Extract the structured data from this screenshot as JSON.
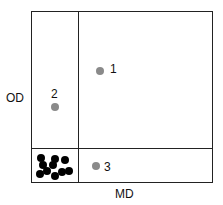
{
  "diagram": {
    "axes": {
      "x_label": "MD",
      "y_label": "OD"
    },
    "points": [
      {
        "label": "1",
        "x": 100,
        "y": 71,
        "lx": 110,
        "ly": 63
      },
      {
        "label": "2",
        "x": 55,
        "y": 107,
        "lx": 51,
        "ly": 88
      },
      {
        "label": "3",
        "x": 96,
        "y": 166,
        "lx": 104,
        "ly": 161
      }
    ],
    "cluster": [
      [
        41,
        158
      ],
      [
        55,
        159
      ],
      [
        65,
        160
      ],
      [
        43,
        165
      ],
      [
        53,
        165
      ],
      [
        40,
        174
      ],
      [
        47,
        171
      ],
      [
        55,
        176
      ],
      [
        62,
        172
      ],
      [
        69,
        171
      ]
    ],
    "colors": {
      "highlight_point": "#8a8a8a",
      "cluster_point": "#000000",
      "line": "#222222"
    }
  }
}
